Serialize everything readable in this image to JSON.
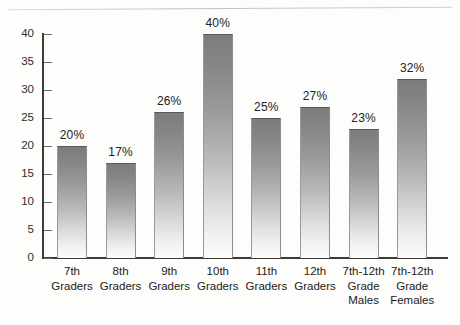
{
  "chart_data": {
    "type": "bar",
    "title": "",
    "xlabel": "",
    "ylabel": "",
    "ylim": [
      0,
      40
    ],
    "ytick_step": 5,
    "grid": false,
    "legend": "none",
    "value_label_suffix": "%",
    "categories": [
      "7th Graders",
      "8th Graders",
      "9th Graders",
      "10th Graders",
      "11th Graders",
      "12th Graders",
      "7th-12th Grade Males",
      "7th-12th Grade Females"
    ],
    "category_lines": [
      [
        "7th",
        "Graders"
      ],
      [
        "8th",
        "Graders"
      ],
      [
        "9th",
        "Graders"
      ],
      [
        "10th",
        "Graders"
      ],
      [
        "11th",
        "Graders"
      ],
      [
        "12th",
        "Graders"
      ],
      [
        "7th-12th",
        "Grade",
        "Males"
      ],
      [
        "7th-12th",
        "Grade",
        "Females"
      ]
    ],
    "values": [
      20,
      17,
      26,
      40,
      25,
      27,
      23,
      32
    ],
    "value_labels": [
      "20%",
      "17%",
      "26%",
      "40%",
      "25%",
      "27%",
      "23%",
      "32%"
    ],
    "ytick_labels": [
      "0",
      "5",
      "10",
      "15",
      "20",
      "25",
      "30",
      "35",
      "40"
    ],
    "ytick_values": [
      0,
      5,
      10,
      15,
      20,
      25,
      30,
      35,
      40
    ],
    "bar_color_top": "#7e7c7a",
    "bar_color_bottom": "#fbfbfa",
    "axis_color": "#3d3b39",
    "text_color": "#232120",
    "background": "#fdfdfc"
  },
  "decor": {
    "clipped_header_text": ""
  }
}
